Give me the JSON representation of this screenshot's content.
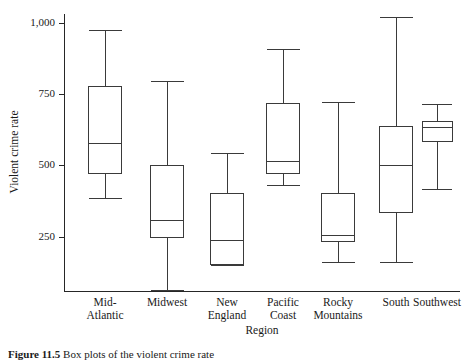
{
  "figure": {
    "ylabel": "Violent crime rate",
    "xlabel": "Region",
    "caption_label": "Figure 11.5",
    "caption_text": "Box plots of the violent crime rate"
  },
  "axis": {
    "y_ticks": [
      {
        "label": "1,000",
        "value": 1000
      },
      {
        "label": "750",
        "value": 750
      },
      {
        "label": "500",
        "value": 500
      },
      {
        "label": "250",
        "value": 250
      }
    ],
    "y_min": 0,
    "y_max": 1080,
    "x_categories": [
      {
        "line1": "Mid-",
        "line2": "Atlantic"
      },
      {
        "line1": "Midwest",
        "line2": ""
      },
      {
        "line1": "New",
        "line2": "England"
      },
      {
        "line1": "Pacific",
        "line2": "Coast"
      },
      {
        "line1": "Rocky",
        "line2": "Mountains"
      },
      {
        "line1": "South",
        "line2": ""
      },
      {
        "line1": "Southwest",
        "line2": ""
      }
    ]
  },
  "chart_data": {
    "type": "box",
    "title": "",
    "xlabel": "Region",
    "ylabel": "Violent crime rate",
    "ylim": [
      0,
      1080
    ],
    "grid": false,
    "legend": "none",
    "categories": [
      "Mid-Atlantic",
      "Midwest",
      "New England",
      "Pacific Coast",
      "Rocky Mountains",
      "South",
      "Southwest"
    ],
    "boxes": [
      {
        "category": "Mid-Atlantic",
        "whisker_low": 385,
        "q1": 473,
        "median": 577,
        "q3": 778,
        "whisker_high": 974
      },
      {
        "category": "Midwest",
        "whisker_low": 63,
        "q1": 247,
        "median": 307,
        "q3": 500,
        "whisker_high": 796
      },
      {
        "category": "New England",
        "whisker_low": 149,
        "q1": 152,
        "median": 239,
        "q3": 401,
        "whisker_high": 542
      },
      {
        "category": "Pacific Coast",
        "whisker_low": 431,
        "q1": 473,
        "median": 516,
        "q3": 717,
        "whisker_high": 907
      },
      {
        "category": "Rocky Mountains",
        "whisker_low": 160,
        "q1": 233,
        "median": 254,
        "q3": 401,
        "whisker_high": 721
      },
      {
        "category": "South",
        "whisker_low": 159,
        "q1": 337,
        "median": 500,
        "q3": 636,
        "whisker_high": 1019
      },
      {
        "category": "Southwest",
        "whisker_low": 415,
        "q1": 585,
        "median": 634,
        "q3": 655,
        "whisker_high": 714
      }
    ]
  },
  "colors": {
    "stroke": "#3a3a3a",
    "axis": "#262626",
    "background": "#ffffff"
  }
}
